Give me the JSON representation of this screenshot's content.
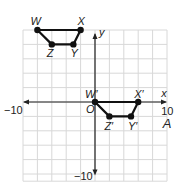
{
  "diagram": {
    "type": "coordinate-plane-translation",
    "grid": {
      "x_min": -10,
      "x_max": 10,
      "y_min": -10,
      "y_max": 11,
      "step": 2,
      "grid_color": "#d8d8d8",
      "axis_color": "#222222"
    },
    "axes": {
      "x_label": "x",
      "y_label": "y",
      "origin_label": "O",
      "x_min_tick_label": "−10",
      "x_max_tick_label": "10",
      "y_min_tick_label": "−10"
    },
    "panel_label": "A",
    "preimage": {
      "name": "WXYZ",
      "vertices": [
        {
          "label": "W",
          "x": -8,
          "y": 10
        },
        {
          "label": "X",
          "x": -2,
          "y": 10
        },
        {
          "label": "Y",
          "x": -3,
          "y": 8
        },
        {
          "label": "Z",
          "x": -6,
          "y": 8
        }
      ]
    },
    "image": {
      "name": "W'X'Y'Z'",
      "vertices": [
        {
          "label": "W′",
          "x": 0,
          "y": 0
        },
        {
          "label": "X′",
          "x": 6,
          "y": 0
        },
        {
          "label": "Y′",
          "x": 5,
          "y": -2
        },
        {
          "label": "Z′",
          "x": 2,
          "y": -2
        }
      ]
    },
    "stroke_color": "#111111"
  }
}
